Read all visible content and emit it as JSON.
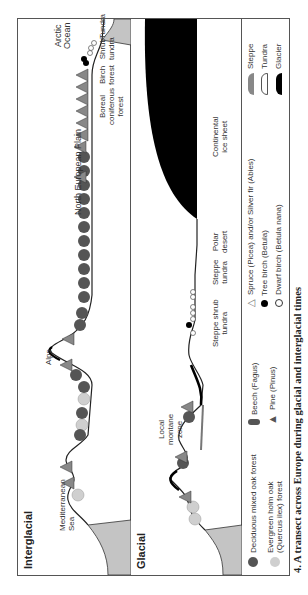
{
  "interglacial": {
    "title": "Interglacial",
    "labels": {
      "sea": [
        "Mediterranean",
        "Sea"
      ],
      "alps": "Alps",
      "plain": "North European Plain",
      "boreal": [
        "Boreal",
        "coniferous",
        "forest"
      ],
      "birch": [
        "Birch",
        "forest"
      ],
      "shrub": [
        "Shrub",
        "tundra"
      ],
      "tundra": "Tundra",
      "arctic": [
        "Arctic",
        "Ocean"
      ]
    }
  },
  "glacial": {
    "title": "Glacial",
    "labels": {
      "montane": [
        "Local",
        "montane",
        "zone"
      ],
      "steppe_shrub": [
        "Steppe shrub",
        "tundra"
      ],
      "steppe_tundra": [
        "Steppe",
        "tundra"
      ],
      "polar": [
        "Polar",
        "desert"
      ],
      "ice": [
        "Continental",
        "ice sheet"
      ]
    }
  },
  "legend": {
    "items": [
      {
        "icon": "deciduous-oak-icon",
        "label": "Deciduous mixed oak forest"
      },
      {
        "icon": "holm-oak-icon",
        "label": "Evergreen holm oak",
        "label2": "(Quercus ilex) forest"
      },
      {
        "icon": "beech-icon",
        "label": "Beech (Fagus)"
      },
      {
        "icon": "pine-icon",
        "label": "Pine (Pinus)"
      },
      {
        "icon": "spruce-icon",
        "label": "Spruce (Picea) and/or Silver fir (Abies)"
      },
      {
        "icon": "tree-birch-icon",
        "label": "Tree birch (Betula)"
      },
      {
        "icon": "dwarf-birch-icon",
        "label": "Dwarf birch (Betula nana)"
      },
      {
        "icon": "steppe-swatch",
        "label": "Steppe"
      },
      {
        "icon": "tundra-swatch",
        "label": "Tundra"
      },
      {
        "icon": "glacier-swatch",
        "label": "Glacier"
      }
    ]
  },
  "colors": {
    "deciduous": "#555555",
    "holm_oak": "#cfcfcf",
    "sea": "#c4c4c4",
    "ice": "#000000",
    "frame": "#555555"
  },
  "caption": "4.  A transect across Europe during glacial and interglacial times"
}
